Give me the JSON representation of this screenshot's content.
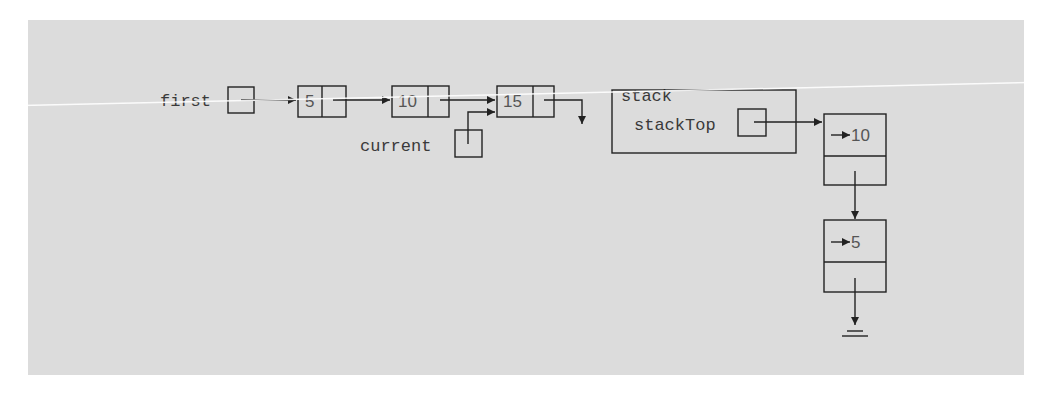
{
  "diagram": {
    "type": "linked-list-and-linked-stack",
    "linked_list": {
      "head_pointer_label": "first",
      "nodes": [
        {
          "info": "5"
        },
        {
          "info": "10"
        },
        {
          "info": "15"
        }
      ],
      "current_pointer_label": "current",
      "current_points_to_index": 2
    },
    "stack": {
      "label": "stack",
      "top_pointer_label": "stackTop",
      "nodes": [
        {
          "info": "10",
          "pointer_prefix": "→"
        },
        {
          "info": "5",
          "pointer_prefix": "→"
        }
      ],
      "terminator": "null-ground-icon"
    }
  },
  "colors": {
    "background": "#dcdcdc",
    "stroke": "#222222",
    "text": "#3a3a3a"
  }
}
